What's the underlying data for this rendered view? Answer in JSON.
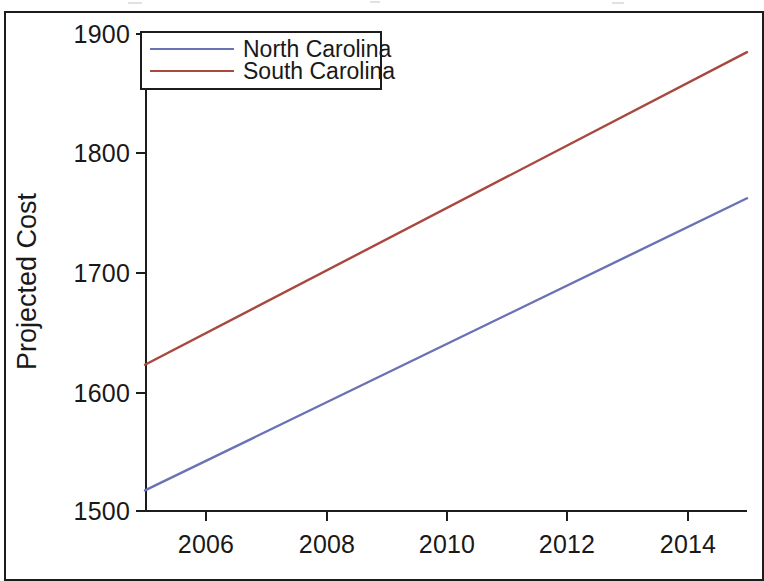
{
  "chart_data": {
    "type": "line",
    "title": "",
    "subtitle": "",
    "xlabel": "",
    "ylabel": "Projected Cost",
    "grid": false,
    "legend_position": "top-left",
    "xlim": [
      2005,
      2015
    ],
    "ylim": [
      1500,
      1900
    ],
    "xticks": [
      "2006",
      "2008",
      "2010",
      "2012",
      "2014"
    ],
    "xtick_values": [
      2006,
      2008,
      2010,
      2012,
      2014
    ],
    "yticks": [
      "1500",
      "1600",
      "1700",
      "1800",
      "1900"
    ],
    "ytick_values": [
      1500,
      1600,
      1700,
      1800,
      1900
    ],
    "x": [
      2005,
      2015
    ],
    "series": [
      {
        "name": "North Carolina",
        "color": "#6a72b4",
        "values": [
          1518,
          1762
        ]
      },
      {
        "name": "South Carolina",
        "color": "#a8483f",
        "values": [
          1623,
          1884
        ]
      }
    ]
  },
  "legend": {
    "items": [
      {
        "label": "North Carolina",
        "color": "#6a72b4"
      },
      {
        "label": "South Carolina",
        "color": "#a8483f"
      }
    ]
  },
  "axes": {
    "y_title": "Projected Cost",
    "y_ticks": [
      "1900",
      "1800",
      "1700",
      "1600",
      "1500"
    ],
    "x_ticks": [
      "2006",
      "2008",
      "2010",
      "2012",
      "2014"
    ]
  },
  "colors": {
    "north_carolina": "#6a72b4",
    "south_carolina": "#a8483f",
    "axis": "#1c1c1c",
    "background": "#ffffff"
  }
}
